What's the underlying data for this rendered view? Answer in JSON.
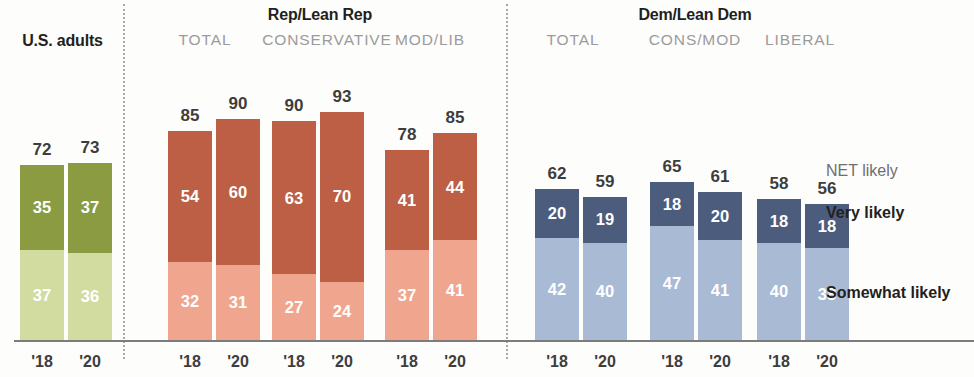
{
  "chart_data": {
    "type": "bar",
    "subtype": "stacked-grouped",
    "title": "",
    "xlabel": "",
    "ylabel": "",
    "ylim": [
      0,
      100
    ],
    "grid": false,
    "legend_position": "right",
    "categories": [
      "'18",
      "'20"
    ],
    "stack_order": [
      "Somewhat likely",
      "Very likely"
    ],
    "legend": [
      {
        "key": "net",
        "label": "NET likely",
        "style": "plain"
      },
      {
        "key": "very",
        "label": "Very likely",
        "style": "bold"
      },
      {
        "key": "somewhat",
        "label": "Somewhat likely",
        "style": "bold"
      }
    ],
    "groups": [
      {
        "id": "us-adults",
        "title": "U.S. adults",
        "subtitle": "",
        "palette": {
          "very": "#8a9b42",
          "somewhat": "#d2dca0"
        },
        "bars": [
          {
            "year": "'18",
            "net": 72,
            "very": 35,
            "somewhat": 37
          },
          {
            "year": "'20",
            "net": 73,
            "very": 37,
            "somewhat": 36
          }
        ]
      },
      {
        "id": "rep-total",
        "title": "Rep/Lean Rep",
        "subtitle": "TOTAL",
        "palette": {
          "very": "#bd5f44",
          "somewhat": "#f0a58e"
        },
        "bars": [
          {
            "year": "'18",
            "net": 85,
            "very": 54,
            "somewhat": 32
          },
          {
            "year": "'20",
            "net": 90,
            "very": 60,
            "somewhat": 31
          }
        ]
      },
      {
        "id": "rep-conservative",
        "title": "",
        "subtitle": "CONSERVATIVE",
        "palette": {
          "very": "#bd5f44",
          "somewhat": "#f0a58e"
        },
        "bars": [
          {
            "year": "'18",
            "net": 90,
            "very": 63,
            "somewhat": 27
          },
          {
            "year": "'20",
            "net": 93,
            "very": 70,
            "somewhat": 24
          }
        ]
      },
      {
        "id": "rep-mod-lib",
        "title": "",
        "subtitle": "MOD/LIB",
        "palette": {
          "very": "#bd5f44",
          "somewhat": "#f0a58e"
        },
        "bars": [
          {
            "year": "'18",
            "net": 78,
            "very": 41,
            "somewhat": 37
          },
          {
            "year": "'20",
            "net": 85,
            "very": 44,
            "somewhat": 41
          }
        ]
      },
      {
        "id": "dem-total",
        "title": "Dem/Lean Dem",
        "subtitle": "TOTAL",
        "palette": {
          "very": "#4c5c7d",
          "somewhat": "#a8bad4"
        },
        "bars": [
          {
            "year": "'18",
            "net": 62,
            "very": 20,
            "somewhat": 42
          },
          {
            "year": "'20",
            "net": 59,
            "very": 19,
            "somewhat": 40
          }
        ]
      },
      {
        "id": "dem-cons-mod",
        "title": "",
        "subtitle": "CONS/MOD",
        "palette": {
          "very": "#4c5c7d",
          "somewhat": "#a8bad4"
        },
        "bars": [
          {
            "year": "'18",
            "net": 65,
            "very": 18,
            "somewhat": 47
          },
          {
            "year": "'20",
            "net": 61,
            "very": 20,
            "somewhat": 41
          }
        ]
      },
      {
        "id": "dem-liberal",
        "title": "",
        "subtitle": "LIBERAL",
        "palette": {
          "very": "#4c5c7d",
          "somewhat": "#a8bad4"
        },
        "bars": [
          {
            "year": "'18",
            "net": 58,
            "very": 18,
            "somewhat": 40
          },
          {
            "year": "'20",
            "net": 56,
            "very": 18,
            "somewhat": 38
          }
        ]
      }
    ]
  },
  "colors": {
    "green_dark": "#8a9b42",
    "green_light": "#d2dca0",
    "red_dark": "#bd5f44",
    "red_light": "#f0a58e",
    "blue_dark": "#4c5c7d",
    "blue_light": "#a8bad4",
    "axis": "#7c7c7c",
    "divider": "#a8a8a8",
    "subtitle_text": "#9b9b9b",
    "value_text": "#3d3d3d"
  },
  "layout": {
    "baseline_y": 340,
    "pixels_per_unit": 2.43,
    "bar_width": 44,
    "bar_gap": 4,
    "group_x": {
      "us-adults": 20,
      "rep-total": 168,
      "rep-conservative": 272,
      "rep-mod-lib": 385,
      "dem-total": 535,
      "dem-cons-mod": 650,
      "dem-liberal": 757
    },
    "dividers_x": [
      123,
      506
    ],
    "legend_x": 826,
    "legend_y": {
      "net": 163,
      "very": 205,
      "somewhat": 285
    }
  }
}
